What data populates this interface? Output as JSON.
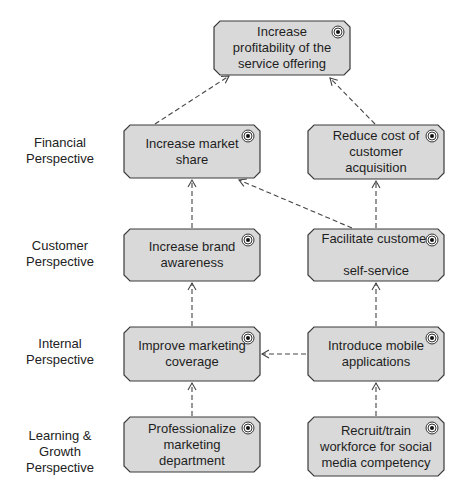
{
  "diagram": {
    "type": "strategy map",
    "lanes": [
      {
        "id": "financial",
        "label": "Financial\nPerspective"
      },
      {
        "id": "customer",
        "label": "Customer\nPerspective"
      },
      {
        "id": "internal",
        "label": "Internal\nPerspective"
      },
      {
        "id": "learning",
        "label": "Learning &\nGrowth\nPerspective"
      }
    ],
    "nodes": {
      "top": {
        "label": "Increase\nprofitability of the\nservice offering",
        "icon": "goal-icon"
      },
      "market_share": {
        "label": "Increase market\nshare",
        "icon": "goal-icon"
      },
      "reduce_cost": {
        "label": "Reduce cost of\ncustomer\nacquisition",
        "icon": "goal-icon"
      },
      "brand_awareness": {
        "label": "Increase brand\nawareness",
        "icon": "goal-icon"
      },
      "self_service": {
        "label": "Facilitate customer\n\nself-service",
        "icon": "goal-icon"
      },
      "marketing_coverage": {
        "label": "Improve marketing\ncoverage",
        "icon": "goal-icon"
      },
      "mobile_apps": {
        "label": "Introduce mobile\napplications",
        "icon": "goal-icon"
      },
      "professionalize": {
        "label": "Professionalize\nmarketing\ndepartment",
        "icon": "goal-icon"
      },
      "recruit_train": {
        "label": "Recruit/train\nworkforce for social\nmedia competency",
        "icon": "goal-icon"
      }
    },
    "edges": [
      {
        "from": "market_share",
        "to": "top",
        "style": "dashed-arrow"
      },
      {
        "from": "reduce_cost",
        "to": "top",
        "style": "dashed-arrow"
      },
      {
        "from": "brand_awareness",
        "to": "market_share",
        "style": "dashed-arrow"
      },
      {
        "from": "self_service",
        "to": "market_share",
        "style": "dashed-arrow"
      },
      {
        "from": "self_service",
        "to": "reduce_cost",
        "style": "dashed-arrow"
      },
      {
        "from": "marketing_coverage",
        "to": "brand_awareness",
        "style": "dashed-arrow"
      },
      {
        "from": "mobile_apps",
        "to": "self_service",
        "style": "dashed-arrow"
      },
      {
        "from": "mobile_apps",
        "to": "marketing_coverage",
        "style": "dashed-arrow"
      },
      {
        "from": "professionalize",
        "to": "marketing_coverage",
        "style": "dashed-arrow"
      },
      {
        "from": "recruit_train",
        "to": "mobile_apps",
        "style": "dashed-arrow"
      }
    ],
    "colors": {
      "node_fill": "#d9d9d9",
      "node_stroke": "#3a3a3a",
      "edge": "#444444"
    }
  }
}
